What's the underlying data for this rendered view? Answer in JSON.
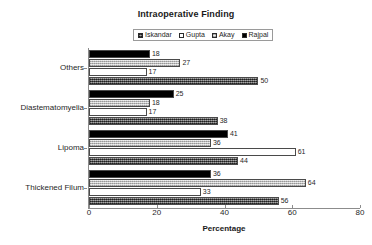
{
  "chart_data": {
    "type": "bar",
    "orientation": "horizontal",
    "title": "Intraoperative Finding",
    "xlabel": "Percentage",
    "ylabel": "",
    "xlim": [
      0,
      80
    ],
    "xticks": [
      0,
      20,
      40,
      60,
      80
    ],
    "grid": false,
    "legend_position": "top-center",
    "categories": [
      "Others",
      "Diastematomyelia",
      "Lipoma",
      "Thickened Filum"
    ],
    "series": [
      {
        "name": "Iskandar",
        "swatch": "dark-dotted",
        "color": "#5d5d5d",
        "values": [
          50,
          38,
          44,
          56
        ]
      },
      {
        "name": "Gupta",
        "swatch": "white",
        "color": "#ffffff",
        "values": [
          17,
          17,
          61,
          33
        ]
      },
      {
        "name": "Akay",
        "swatch": "light-dotted",
        "color": "#c9c9c9",
        "values": [
          27,
          18,
          36,
          64
        ]
      },
      {
        "name": "Rajpal",
        "swatch": "black",
        "color": "#000000",
        "values": [
          18,
          25,
          41,
          36
        ]
      }
    ],
    "bar_draw_order_top_to_bottom": [
      "Rajpal",
      "Akay",
      "Gupta",
      "Iskandar"
    ]
  },
  "legend": {
    "entries": [
      {
        "label": "Iskandar"
      },
      {
        "label": "Gupta"
      },
      {
        "label": "Akay"
      },
      {
        "label": "Rajpal"
      }
    ]
  }
}
